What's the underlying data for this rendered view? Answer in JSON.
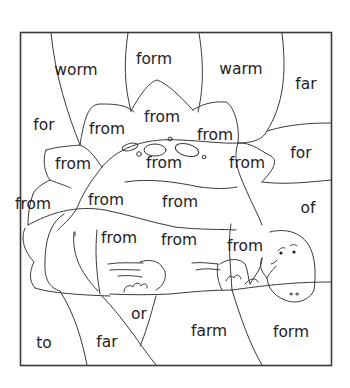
{
  "worksheet": {
    "words": [
      {
        "id": "w0",
        "text": "worm",
        "x": 76,
        "y": 70
      },
      {
        "id": "w1",
        "text": "form",
        "x": 154,
        "y": 59
      },
      {
        "id": "w2",
        "text": "warm",
        "x": 241,
        "y": 69
      },
      {
        "id": "w3",
        "text": "far",
        "x": 306,
        "y": 84
      },
      {
        "id": "w4",
        "text": "for",
        "x": 44,
        "y": 125
      },
      {
        "id": "w5",
        "text": "from",
        "x": 107,
        "y": 129
      },
      {
        "id": "w6",
        "text": "from",
        "x": 162,
        "y": 117
      },
      {
        "id": "w7",
        "text": "from",
        "x": 215,
        "y": 135
      },
      {
        "id": "w8",
        "text": "for",
        "x": 301,
        "y": 153
      },
      {
        "id": "w9",
        "text": "from",
        "x": 73,
        "y": 164
      },
      {
        "id": "w10",
        "text": "from",
        "x": 164,
        "y": 163
      },
      {
        "id": "w11",
        "text": "from",
        "x": 247,
        "y": 163
      },
      {
        "id": "w12",
        "text": "from",
        "x": 33,
        "y": 204
      },
      {
        "id": "w13",
        "text": "from",
        "x": 106,
        "y": 200
      },
      {
        "id": "w14",
        "text": "from",
        "x": 180,
        "y": 202
      },
      {
        "id": "w15",
        "text": "of",
        "x": 308,
        "y": 208
      },
      {
        "id": "w16",
        "text": "from",
        "x": 119,
        "y": 238
      },
      {
        "id": "w17",
        "text": "from",
        "x": 245,
        "y": 246
      },
      {
        "id": "w18",
        "text": "from",
        "x": 179,
        "y": 240
      },
      {
        "id": "w19",
        "text": "or",
        "x": 139,
        "y": 314
      },
      {
        "id": "w20",
        "text": "to",
        "x": 44,
        "y": 343
      },
      {
        "id": "w21",
        "text": "far",
        "x": 107,
        "y": 342
      },
      {
        "id": "w22",
        "text": "farm",
        "x": 209,
        "y": 331
      },
      {
        "id": "w23",
        "text": "form",
        "x": 291,
        "y": 332
      }
    ]
  }
}
